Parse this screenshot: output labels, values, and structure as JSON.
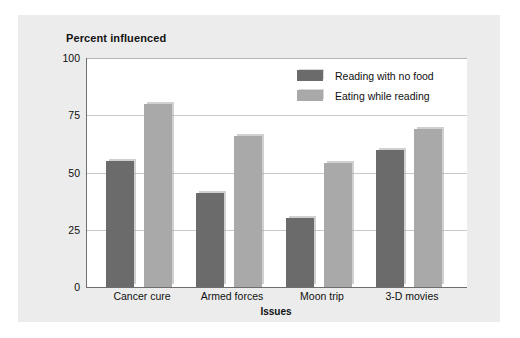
{
  "chart_data": {
    "type": "bar",
    "title": "Percent influenced",
    "xlabel": "Issues",
    "ylabel": "Percent influenced",
    "categories": [
      "Cancer cure",
      "Armed forces",
      "Moon trip",
      "3-D movies"
    ],
    "series": [
      {
        "name": "Reading with no food",
        "color": "#6b6b6b",
        "values": [
          55,
          41,
          30,
          60
        ]
      },
      {
        "name": "Eating while reading",
        "color": "#a9a9a9",
        "values": [
          80,
          66,
          54,
          69
        ]
      }
    ],
    "ylim": [
      0,
      100
    ],
    "yticks": [
      "0",
      "25",
      "50",
      "75",
      "100"
    ],
    "ytick_values": [
      0,
      25,
      50,
      75,
      100
    ],
    "grid": true,
    "legend_position": "top-right",
    "plot_background": "#ffffff",
    "panel_background": "#ececec",
    "axis_color": "#6e6e6e",
    "grid_color": "#c9c9c9"
  }
}
